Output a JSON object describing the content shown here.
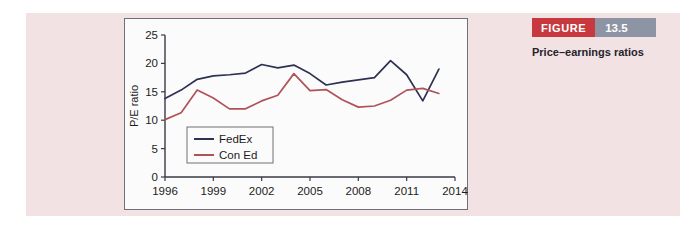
{
  "figure": {
    "banner_word": "FIGURE",
    "banner_number": "13.5",
    "caption": "Price–earnings ratios",
    "banner_word_color": "#c8393f",
    "banner_number_color": "#8d94a3",
    "panel_background": "#f2e2e4"
  },
  "chart_data": {
    "type": "line",
    "title": "",
    "xlabel": "",
    "ylabel": "P/E ratio",
    "xlim": [
      1996,
      2014
    ],
    "ylim": [
      0,
      25
    ],
    "yticks": [
      0,
      5,
      10,
      15,
      20,
      25
    ],
    "ytick_labels": [
      "0",
      "5",
      "10",
      "15",
      "20",
      "25"
    ],
    "xticks": [
      1996,
      1999,
      2002,
      2005,
      2008,
      2011,
      2014
    ],
    "xtick_labels": [
      "1996",
      "1999",
      "2002",
      "2005",
      "2008",
      "2011",
      "2014"
    ],
    "grid": false,
    "legend_position": "lower-left",
    "x": [
      1996,
      1997,
      1998,
      1999,
      2000,
      2001,
      2002,
      2003,
      2004,
      2005,
      2006,
      2007,
      2008,
      2009,
      2010,
      2011,
      2012,
      2013
    ],
    "series": [
      {
        "name": "FedEx",
        "color": "#2d3152",
        "values": [
          13.8,
          15.3,
          17.2,
          17.8,
          18.0,
          18.3,
          19.8,
          19.2,
          19.7,
          18.2,
          16.2,
          16.7,
          17.1,
          17.5,
          20.5,
          18.0,
          13.4,
          19.0
        ]
      },
      {
        "name": "Con Ed",
        "color": "#b05358",
        "values": [
          10.1,
          11.3,
          15.3,
          13.9,
          12.0,
          12.0,
          13.4,
          14.4,
          18.2,
          15.2,
          15.4,
          13.6,
          12.3,
          12.5,
          13.5,
          15.3,
          15.6,
          14.7
        ]
      }
    ]
  }
}
